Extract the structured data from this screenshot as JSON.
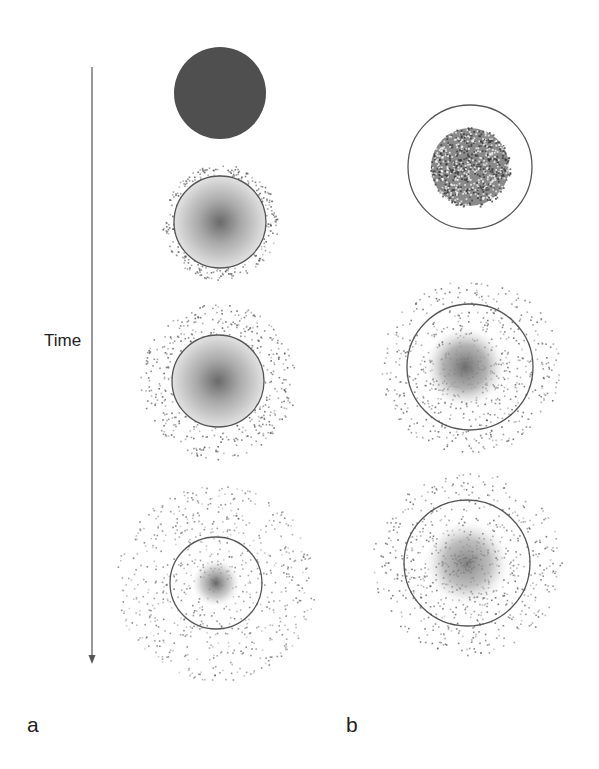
{
  "figure": {
    "time_axis_label": "Time",
    "panel_labels": {
      "a": "a",
      "b": "b"
    },
    "colors": {
      "background": "#ffffff",
      "solid_disk": "#4f4f4f",
      "outline": "#555555",
      "dots": "#555555",
      "arrow": "#777777"
    },
    "panel_a": {
      "stages": [
        {
          "type": "solid-disk",
          "cx": 220,
          "cy": 93,
          "r": 46
        },
        {
          "type": "gradient-disk-with-halo",
          "cx": 220,
          "cy": 222,
          "r": 46,
          "halo_r": 58,
          "dots": 260
        },
        {
          "type": "gradient-disk-with-halo",
          "cx": 218,
          "cy": 381,
          "r": 46,
          "halo_r": 78,
          "dots": 420
        },
        {
          "type": "ring-with-diffuse-cloud",
          "cx": 216,
          "cy": 583,
          "r": 46,
          "core_r": 22,
          "halo_r": 100,
          "dots": 700
        }
      ]
    },
    "panel_b": {
      "stages": [
        {
          "type": "ring-with-speckled-core",
          "cx": 470,
          "cy": 167,
          "r": 62,
          "core_r": 40,
          "dots": 900
        },
        {
          "type": "ring-with-cloud",
          "cx": 470,
          "cy": 367,
          "r": 63,
          "core_r": 40,
          "halo_r": 90,
          "dots": 700
        },
        {
          "type": "ring-with-cloud",
          "cx": 467,
          "cy": 563,
          "r": 63,
          "core_r": 40,
          "halo_r": 95,
          "dots": 750
        }
      ]
    }
  }
}
